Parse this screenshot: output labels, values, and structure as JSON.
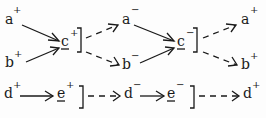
{
  "diagram": {
    "top": {
      "nodes": [
        {
          "id": "a1",
          "base": "a",
          "sign": "+",
          "x": 6,
          "y": 22
        },
        {
          "id": "b1",
          "base": "b",
          "sign": "+",
          "x": 6,
          "y": 65
        },
        {
          "id": "c1",
          "base": "c",
          "sign": "+",
          "x": 62,
          "y": 44,
          "underline": true
        },
        {
          "id": "a2",
          "base": "a",
          "sign": "−",
          "x": 123,
          "y": 22
        },
        {
          "id": "b2",
          "base": "b",
          "sign": "−",
          "x": 124,
          "y": 67
        },
        {
          "id": "c2",
          "base": "c",
          "sign": "−",
          "x": 178,
          "y": 44,
          "underline": true
        },
        {
          "id": "a3",
          "base": "a",
          "sign": "+",
          "x": 242,
          "y": 22
        },
        {
          "id": "b3",
          "base": "b",
          "sign": "+",
          "x": 242,
          "y": 67
        }
      ]
    },
    "bottom": {
      "nodes": [
        {
          "id": "d1",
          "base": "d",
          "sign": "+",
          "x": 5,
          "y": 96
        },
        {
          "id": "e1",
          "base": "e",
          "sign": "+",
          "x": 57,
          "y": 96,
          "underline": true
        },
        {
          "id": "d2",
          "base": "d",
          "sign": "−",
          "x": 125,
          "y": 96
        },
        {
          "id": "e2",
          "base": "e",
          "sign": "−",
          "x": 167,
          "y": 96,
          "underline": true
        },
        {
          "id": "d3",
          "base": "d",
          "sign": "+",
          "x": 244,
          "y": 96
        }
      ]
    },
    "edges": [
      {
        "from": "a+",
        "to": "c+",
        "style": "solid"
      },
      {
        "from": "b+",
        "to": "c+",
        "style": "solid"
      },
      {
        "from": "c+",
        "to": "a−",
        "style": "dashed"
      },
      {
        "from": "c+",
        "to": "b−",
        "style": "dashed"
      },
      {
        "from": "a−",
        "to": "c−",
        "style": "solid"
      },
      {
        "from": "b−",
        "to": "c−",
        "style": "solid"
      },
      {
        "from": "c−",
        "to": "a+",
        "style": "dashed"
      },
      {
        "from": "c−",
        "to": "b+",
        "style": "dashed"
      },
      {
        "from": "d+",
        "to": "e+",
        "style": "solid"
      },
      {
        "from": "e+",
        "to": "d−",
        "style": "dashed"
      },
      {
        "from": "d−",
        "to": "e−",
        "style": "solid"
      },
      {
        "from": "e−",
        "to": "d+",
        "style": "dashed"
      }
    ]
  },
  "labels": {
    "a1": "a",
    "a1s": "+",
    "b1": "b",
    "b1s": "+",
    "c1": "c",
    "c1s": "+",
    "a2": "a",
    "a2s": "−",
    "b2": "b",
    "b2s": "−",
    "c2": "c",
    "c2s": "−",
    "a3": "a",
    "a3s": "+",
    "b3": "b",
    "b3s": "+",
    "d1": "d",
    "d1s": "+",
    "e1": "e",
    "e1s": "+",
    "d2": "d",
    "d2s": "−",
    "e2": "e",
    "e2s": "−",
    "d3": "d",
    "d3s": "+"
  }
}
